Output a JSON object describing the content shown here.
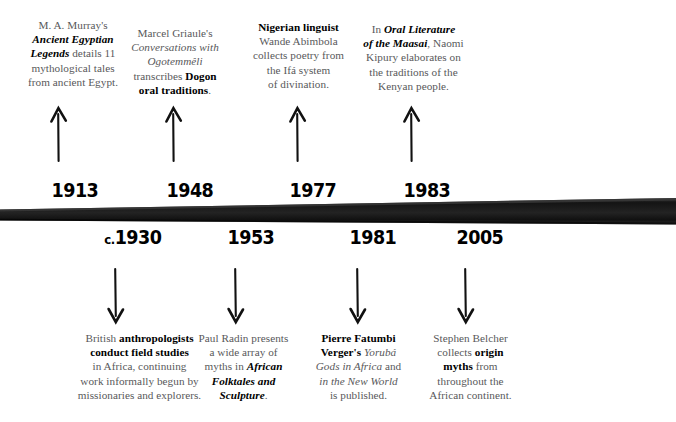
{
  "timeline": {
    "bar_color": "#1a1a1a",
    "text_color": "#58585a",
    "emphasis_color": "#000000",
    "events_above": [
      {
        "year": "1913",
        "arrow": "up-arrow-icon",
        "lines": [
          [
            {
              "t": "M. A. Murray's",
              "s": "plain"
            }
          ],
          [
            {
              "t": "Ancient Egyptian",
              "s": "bolditalic"
            }
          ],
          [
            {
              "t": "Legends",
              "s": "bolditalic"
            },
            {
              "t": " details 11",
              "s": "plain"
            }
          ],
          [
            {
              "t": "mythological tales",
              "s": "plain"
            }
          ],
          [
            {
              "t": "from ancient Egypt.",
              "s": "plain"
            }
          ]
        ]
      },
      {
        "year": "1948",
        "arrow": "up-arrow-icon",
        "lines": [
          [
            {
              "t": "Marcel Griaule's",
              "s": "plain"
            }
          ],
          [
            {
              "t": "Conversations with",
              "s": "italic"
            }
          ],
          [
            {
              "t": "Ogotemmêli",
              "s": "italic"
            }
          ],
          [
            {
              "t": "transcribes ",
              "s": "plain"
            },
            {
              "t": "Dogon",
              "s": "bold"
            }
          ],
          [
            {
              "t": "oral traditions",
              "s": "bold"
            },
            {
              "t": ".",
              "s": "plain"
            }
          ]
        ]
      },
      {
        "year": "1977",
        "arrow": "up-arrow-icon",
        "lines": [
          [
            {
              "t": "Nigerian linguist",
              "s": "bold"
            }
          ],
          [
            {
              "t": "Wande Abimbola",
              "s": "plain"
            }
          ],
          [
            {
              "t": "collects poetry from",
              "s": "plain"
            }
          ],
          [
            {
              "t": "the Ifá system",
              "s": "plain"
            }
          ],
          [
            {
              "t": "of divination.",
              "s": "plain"
            }
          ]
        ]
      },
      {
        "year": "1983",
        "arrow": "up-arrow-icon",
        "lines": [
          [
            {
              "t": "In ",
              "s": "plain"
            },
            {
              "t": "Oral Literature",
              "s": "bolditalic"
            }
          ],
          [
            {
              "t": "of the Maasai",
              "s": "bolditalic"
            },
            {
              "t": ", Naomi",
              "s": "plain"
            }
          ],
          [
            {
              "t": "Kipury elaborates on",
              "s": "plain"
            }
          ],
          [
            {
              "t": "the traditions of the",
              "s": "plain"
            }
          ],
          [
            {
              "t": "Kenyan people.",
              "s": "plain"
            }
          ]
        ]
      }
    ],
    "events_below": [
      {
        "year": "1930",
        "year_prefix": "c.",
        "arrow": "down-arrow-icon",
        "lines": [
          [
            {
              "t": "British ",
              "s": "plain"
            },
            {
              "t": "anthropologists",
              "s": "bold"
            }
          ],
          [
            {
              "t": "conduct field studies",
              "s": "bold"
            }
          ],
          [
            {
              "t": "in Africa, continuing",
              "s": "plain"
            }
          ],
          [
            {
              "t": "work informally begun by",
              "s": "plain"
            }
          ],
          [
            {
              "t": "missionaries and explorers.",
              "s": "plain"
            }
          ]
        ]
      },
      {
        "year": "1953",
        "arrow": "down-arrow-icon",
        "lines": [
          [
            {
              "t": "Paul Radin presents",
              "s": "plain"
            }
          ],
          [
            {
              "t": "a wide array of",
              "s": "plain"
            }
          ],
          [
            {
              "t": "myths in ",
              "s": "plain"
            },
            {
              "t": "African",
              "s": "bolditalic"
            }
          ],
          [
            {
              "t": "Folktales and",
              "s": "bolditalic"
            }
          ],
          [
            {
              "t": "Sculpture",
              "s": "bolditalic"
            },
            {
              "t": ".",
              "s": "plain"
            }
          ]
        ]
      },
      {
        "year": "1981",
        "arrow": "down-arrow-icon",
        "lines": [
          [
            {
              "t": "Pierre Fatumbi",
              "s": "bold"
            }
          ],
          [
            {
              "t": "Verger's",
              "s": "bold"
            },
            {
              "t": " Yorubá",
              "s": "italic"
            }
          ],
          [
            {
              "t": "Gods in Africa",
              "s": "italic"
            },
            {
              "t": " and",
              "s": "plain"
            }
          ],
          [
            {
              "t": "in the New World",
              "s": "italic"
            }
          ],
          [
            {
              "t": "is published.",
              "s": "plain"
            }
          ]
        ]
      },
      {
        "year": "2005",
        "arrow": "down-arrow-icon",
        "lines": [
          [
            {
              "t": "Stephen Belcher",
              "s": "plain"
            }
          ],
          [
            {
              "t": "collects ",
              "s": "plain"
            },
            {
              "t": "origin",
              "s": "bold"
            }
          ],
          [
            {
              "t": "myths",
              "s": "bold"
            },
            {
              "t": " from",
              "s": "plain"
            }
          ],
          [
            {
              "t": "throughout the",
              "s": "plain"
            }
          ],
          [
            {
              "t": "African continent.",
              "s": "plain"
            }
          ]
        ]
      }
    ]
  }
}
